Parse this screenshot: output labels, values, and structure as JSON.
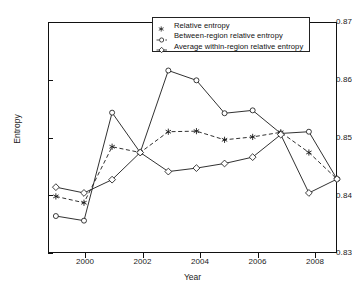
{
  "chart_data": {
    "type": "line",
    "title": "",
    "subtitle": "",
    "xlabel": "Year",
    "ylabel": "Entropy",
    "x": [
      1999,
      2000,
      2001,
      2002,
      2003,
      2004,
      2005,
      2006,
      2007,
      2008,
      2009
    ],
    "xlim": [
      1998.72,
      2009.0
    ],
    "ylim": [
      0.83,
      0.87
    ],
    "xticks": [
      2000,
      2002,
      2004,
      2006,
      2008
    ],
    "xtick_labels": [
      "2000",
      "2002",
      "2004",
      "2006",
      "2008"
    ],
    "yticks": [
      0.83,
      0.84,
      0.85,
      0.86,
      0.87
    ],
    "ytick_labels": [
      "0.83",
      "0.84",
      "0.85",
      "0.86",
      "0.87"
    ],
    "grid": false,
    "legend_position": "top-center",
    "series": [
      {
        "name": "Relative entropy",
        "marker": "star",
        "linestyle": "dashed",
        "color": "#1a1a1a",
        "values": [
          0.8398,
          0.8387,
          0.8484,
          0.8474,
          0.851,
          0.8511,
          0.8496,
          0.8501,
          0.8509,
          0.8474,
          0.8428
        ]
      },
      {
        "name": "Between-region relative entropy",
        "marker": "circle",
        "linestyle": "solid",
        "color": "#1a1a1a",
        "values": [
          0.8364,
          0.8356,
          0.8543,
          0.8474,
          0.8616,
          0.8599,
          0.8542,
          0.8547,
          0.8507,
          0.851,
          0.8428
        ]
      },
      {
        "name": "Average within-region relative entropy",
        "marker": "diamond",
        "linestyle": "solid",
        "color": "#1a1a1a",
        "values": [
          0.8414,
          0.8404,
          0.8427,
          0.8474,
          0.8441,
          0.8447,
          0.8455,
          0.8466,
          0.8505,
          0.8404,
          0.8428
        ]
      }
    ]
  },
  "legend": {
    "items": [
      {
        "label": "Relative entropy",
        "marker": "star-marker",
        "line": "none"
      },
      {
        "label": "Between-region relative entropy",
        "marker": "circle-marker",
        "line": "dashed"
      },
      {
        "label": "Average within-region relative entropy",
        "marker": "diamond-marker",
        "line": "solid"
      }
    ]
  },
  "axes": {
    "y_title": "Entropy",
    "x_title": "Year"
  }
}
